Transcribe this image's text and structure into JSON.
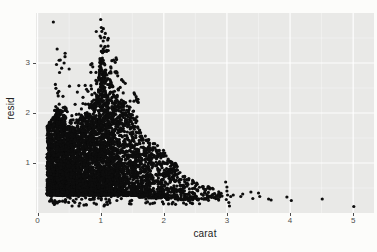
{
  "figure": {
    "kind": "ggplot-style scatter figure on white page",
    "page_bg": "#fcfcfa"
  },
  "chart_data": {
    "type": "scatter",
    "title": "",
    "xlabel": "carat",
    "ylabel": "resid",
    "x_ticks": [
      0,
      1,
      2,
      3,
      4,
      5
    ],
    "y_ticks": [
      1,
      2,
      3
    ],
    "x_minor_ticks": [
      0.5,
      1.5,
      2.5,
      3.5,
      4.5
    ],
    "y_minor_ticks": [
      0.5,
      1.5,
      2.5,
      3.5
    ],
    "xlim": [
      -0.025,
      5.33
    ],
    "ylim": [
      0,
      4.0
    ],
    "grid": "on",
    "legend": "none",
    "panel_bg": "#e9e9e7",
    "grid_major_color": "rgba(255,255,255,0.95)",
    "grid_minor_color": "rgba(255,255,255,0.5)",
    "tick_label_color": "#4d4d4d",
    "axis_title_color": "#222222",
    "point_color": "#0d0d0d",
    "point_radius": 1.6,
    "seed": 1337,
    "dense_bands": [
      {
        "x0": 0.15,
        "x1": 0.3,
        "n": 650,
        "y0": 0.36,
        "ya": 1.75,
        "yb": 2.0,
        "pw": 1.5
      },
      {
        "x0": 0.3,
        "x1": 0.45,
        "n": 800,
        "y0": 0.36,
        "ya": 2.1,
        "yb": 2.0,
        "pw": 1.6
      },
      {
        "x0": 0.45,
        "x1": 0.62,
        "n": 700,
        "y0": 0.36,
        "ya": 1.75,
        "yb": 1.7,
        "pw": 1.5
      },
      {
        "x0": 0.62,
        "x1": 0.82,
        "n": 700,
        "y0": 0.36,
        "ya": 1.9,
        "yb": 2.05,
        "pw": 1.6
      },
      {
        "x0": 0.82,
        "x1": 0.96,
        "n": 500,
        "y0": 0.36,
        "ya": 2.15,
        "yb": 2.45,
        "pw": 1.7
      },
      {
        "x0": 0.96,
        "x1": 1.01,
        "n": 300,
        "y0": 0.36,
        "ya": 2.6,
        "yb": 3.45,
        "pw": 2.1
      },
      {
        "x0": 1.01,
        "x1": 1.09,
        "n": 380,
        "y0": 0.36,
        "ya": 3.35,
        "yb": 2.9,
        "pw": 2.1
      },
      {
        "x0": 1.09,
        "x1": 1.22,
        "n": 480,
        "y0": 0.36,
        "ya": 2.85,
        "yb": 2.45,
        "pw": 1.9
      },
      {
        "x0": 1.22,
        "x1": 1.38,
        "n": 420,
        "y0": 0.36,
        "ya": 2.45,
        "yb": 2.2,
        "pw": 1.8
      },
      {
        "x0": 1.38,
        "x1": 1.58,
        "n": 380,
        "y0": 0.35,
        "ya": 2.25,
        "yb": 1.95,
        "pw": 1.8
      },
      {
        "x0": 1.58,
        "x1": 1.78,
        "n": 280,
        "y0": 0.32,
        "ya": 1.75,
        "yb": 1.45,
        "pw": 1.6
      },
      {
        "x0": 1.78,
        "x1": 2.02,
        "n": 215,
        "y0": 0.3,
        "ya": 1.45,
        "yb": 1.25,
        "pw": 1.5
      },
      {
        "x0": 2.02,
        "x1": 2.22,
        "n": 130,
        "y0": 0.28,
        "ya": 1.2,
        "yb": 0.95,
        "pw": 1.4
      },
      {
        "x0": 2.22,
        "x1": 2.48,
        "n": 85,
        "y0": 0.26,
        "ya": 0.92,
        "yb": 0.65,
        "pw": 1.3
      },
      {
        "x0": 2.48,
        "x1": 2.72,
        "n": 42,
        "y0": 0.25,
        "ya": 0.64,
        "yb": 0.52,
        "pw": 1.2
      },
      {
        "x0": 2.72,
        "x1": 2.92,
        "n": 24,
        "y0": 0.24,
        "ya": 0.56,
        "yb": 0.45,
        "pw": 1.2
      }
    ],
    "sparse_bands": [
      {
        "x0": 0.26,
        "x1": 0.46,
        "n": 26,
        "y0": 2.05,
        "ya": 3.3,
        "yb": 3.4,
        "pw": 2.0
      },
      {
        "x0": 0.46,
        "x1": 0.62,
        "n": 13,
        "y0": 1.7,
        "ya": 2.85,
        "yb": 2.9,
        "pw": 1.8
      },
      {
        "x0": 0.62,
        "x1": 0.82,
        "n": 13,
        "y0": 1.95,
        "ya": 2.55,
        "yb": 2.6,
        "pw": 1.8
      },
      {
        "x0": 0.84,
        "x1": 0.96,
        "n": 12,
        "y0": 2.35,
        "ya": 3.05,
        "yb": 3.1,
        "pw": 1.8
      },
      {
        "x0": 1.0,
        "x1": 1.12,
        "n": 16,
        "y0": 3.2,
        "ya": 3.75,
        "yb": 3.6,
        "pw": 1.5
      },
      {
        "x0": 1.09,
        "x1": 1.26,
        "n": 14,
        "y0": 2.8,
        "ya": 3.3,
        "yb": 3.2,
        "pw": 2.0
      },
      {
        "x0": 1.26,
        "x1": 1.42,
        "n": 10,
        "y0": 2.4,
        "ya": 2.75,
        "yb": 2.7,
        "pw": 1.8
      },
      {
        "x0": 1.42,
        "x1": 1.6,
        "n": 10,
        "y0": 2.2,
        "ya": 2.5,
        "yb": 2.35,
        "pw": 1.8
      },
      {
        "x0": 0.18,
        "x1": 1.2,
        "n": 70,
        "y0": 0.14,
        "ya": 0.4,
        "yb": 0.4,
        "pw": 1.0
      },
      {
        "x0": 1.2,
        "x1": 2.4,
        "n": 40,
        "y0": 0.16,
        "ya": 0.38,
        "yb": 0.38,
        "pw": 1.0
      },
      {
        "x0": 2.4,
        "x1": 2.95,
        "n": 12,
        "y0": 0.18,
        "ya": 0.35,
        "yb": 0.35,
        "pw": 1.0
      }
    ],
    "outlier_points": [
      [
        0.25,
        3.82
      ],
      [
        0.31,
        3.28
      ],
      [
        0.36,
        3.06
      ],
      [
        0.3,
        2.97
      ],
      [
        0.42,
        3.0
      ],
      [
        0.5,
        2.88
      ],
      [
        0.93,
        3.63
      ],
      [
        1.0,
        3.87
      ],
      [
        1.01,
        3.71
      ],
      [
        0.99,
        3.54
      ],
      [
        1.04,
        3.44
      ],
      [
        1.07,
        3.33
      ],
      [
        1.12,
        3.25
      ],
      [
        2.98,
        0.62
      ],
      [
        3.0,
        0.52
      ],
      [
        3.0,
        0.44
      ],
      [
        3.01,
        0.36
      ],
      [
        2.99,
        0.27
      ],
      [
        3.03,
        0.21
      ],
      [
        3.06,
        0.33
      ],
      [
        3.1,
        0.36
      ],
      [
        3.04,
        0.14
      ],
      [
        3.22,
        0.33
      ],
      [
        3.25,
        0.38
      ],
      [
        3.38,
        0.42
      ],
      [
        3.41,
        0.29
      ],
      [
        3.5,
        0.4
      ],
      [
        3.52,
        0.33
      ],
      [
        3.66,
        0.28
      ],
      [
        3.7,
        0.26
      ],
      [
        3.95,
        0.32
      ],
      [
        4.02,
        0.25
      ],
      [
        4.51,
        0.28
      ],
      [
        5.01,
        0.13
      ]
    ]
  }
}
